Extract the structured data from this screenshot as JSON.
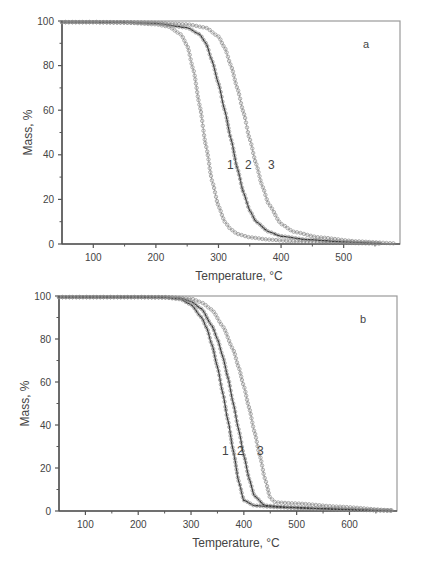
{
  "chart_data": [
    {
      "type": "line",
      "panel_label": "a",
      "title": "",
      "xlabel": "Temperature, °C",
      "ylabel": "Mass, %",
      "xlim": [
        50,
        590
      ],
      "ylim": [
        0,
        100
      ],
      "xticks": [
        100,
        200,
        300,
        400,
        500
      ],
      "yticks": [
        0,
        20,
        40,
        60,
        80,
        100
      ],
      "grid": false,
      "legend": "inline curve labels 1, 2, 3",
      "series": [
        {
          "name": "1",
          "marker": "open-circle",
          "x": [
            50,
            100,
            150,
            200,
            220,
            240,
            250,
            260,
            270,
            280,
            290,
            300,
            310,
            320,
            330,
            350,
            380,
            420,
            480,
            560
          ],
          "y": [
            99.5,
            99.5,
            99.3,
            98.5,
            97.5,
            94,
            89,
            78,
            62,
            44,
            28,
            17,
            10,
            6.5,
            4.5,
            3,
            2,
            1.2,
            0.6,
            0.2
          ]
        },
        {
          "name": "2",
          "marker": "line+open-circle",
          "x": [
            50,
            100,
            150,
            200,
            250,
            270,
            280,
            290,
            300,
            310,
            320,
            330,
            340,
            350,
            360,
            380,
            400,
            440,
            500,
            560
          ],
          "y": [
            99.5,
            99.5,
            99.4,
            99,
            97,
            94,
            90,
            82,
            72,
            60,
            47,
            34,
            23,
            15,
            10,
            5.5,
            3.5,
            2,
            1,
            0.3
          ]
        },
        {
          "name": "3",
          "marker": "open-circle",
          "x": [
            50,
            100,
            150,
            200,
            250,
            280,
            300,
            310,
            320,
            330,
            340,
            350,
            360,
            370,
            380,
            400,
            420,
            460,
            520,
            580
          ],
          "y": [
            99.5,
            99.5,
            99.4,
            99.2,
            98.5,
            97,
            93,
            88,
            80,
            70,
            59,
            47,
            36,
            26,
            18,
            9,
            5.5,
            3,
            1.2,
            0.3
          ]
        }
      ]
    },
    {
      "type": "line",
      "panel_label": "b",
      "title": "",
      "xlabel": "Temperature, °C",
      "ylabel": "Mass, %",
      "xlim": [
        50,
        690
      ],
      "ylim": [
        0,
        100
      ],
      "xticks": [
        100,
        200,
        300,
        400,
        500,
        600
      ],
      "yticks": [
        0,
        20,
        40,
        60,
        80,
        100
      ],
      "grid": false,
      "legend": "inline curve labels 1, 2, 3",
      "series": [
        {
          "name": "1",
          "marker": "line+open-circle",
          "x": [
            50,
            100,
            200,
            250,
            280,
            300,
            320,
            330,
            340,
            350,
            360,
            370,
            380,
            390,
            400,
            420,
            460,
            520,
            600,
            680
          ],
          "y": [
            99.5,
            99.5,
            99.5,
            99.3,
            98.5,
            96,
            90,
            85,
            77,
            67,
            55,
            42,
            28,
            14,
            5,
            2.5,
            1.8,
            1.2,
            0.6,
            0.2
          ]
        },
        {
          "name": "2",
          "marker": "line+open-circle",
          "x": [
            50,
            100,
            200,
            250,
            280,
            300,
            320,
            340,
            350,
            360,
            370,
            380,
            390,
            400,
            410,
            420,
            440,
            480,
            560,
            680
          ],
          "y": [
            99.5,
            99.5,
            99.5,
            99.4,
            99,
            97.5,
            94,
            86,
            80,
            72,
            62,
            50,
            38,
            26,
            15,
            7,
            2.5,
            1.8,
            1,
            0.2
          ]
        },
        {
          "name": "3",
          "marker": "open-circle",
          "x": [
            50,
            100,
            200,
            250,
            300,
            320,
            340,
            360,
            380,
            390,
            400,
            410,
            420,
            430,
            440,
            450,
            460,
            500,
            580,
            680
          ],
          "y": [
            99.5,
            99.5,
            99.5,
            99.5,
            98.8,
            97,
            93.5,
            86,
            75,
            67,
            58,
            48,
            37,
            26,
            15,
            6,
            4,
            3.5,
            2,
            0.3
          ]
        }
      ]
    }
  ],
  "panels": {
    "a": {
      "label": "a",
      "xlabel": "Temperature, °C",
      "ylabel": "Mass, %",
      "curve_labels": [
        "1",
        "2",
        "3"
      ]
    },
    "b": {
      "label": "b",
      "xlabel": "Temperature, °C",
      "ylabel": "Mass, %",
      "curve_labels": [
        "1",
        "2",
        "3"
      ]
    }
  },
  "colors": {
    "axis": "#555555",
    "curve_line": "#3a3a3a",
    "marker": "#8a8a8a",
    "text": "#444444"
  }
}
